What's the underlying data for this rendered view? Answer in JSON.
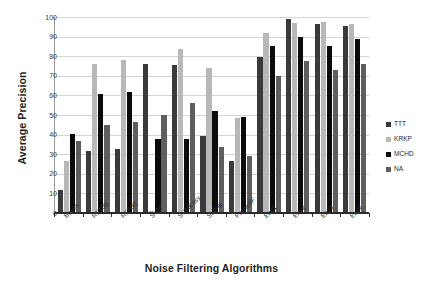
{
  "chart_data": {
    "type": "bar",
    "title": "",
    "xlabel": "Noise Filtering Algorithms",
    "ylabel": "Average Precision",
    "ylim": [
      0,
      100
    ],
    "yticks": [
      0,
      10,
      20,
      30,
      40,
      50,
      60,
      70,
      80,
      90,
      100
    ],
    "grid": true,
    "legend_position": "right",
    "categories": [
      "Bayes",
      "RF100",
      "RF500",
      "SVM",
      "SVMEasy",
      "SatFilt",
      "PruneSF",
      "Ens1",
      "Ens2",
      "Ens3",
      "Ens4"
    ],
    "series": [
      {
        "name": "TTT",
        "color": "#3a3a3a",
        "values": [
          11,
          31,
          32,
          75.3,
          75.1,
          39,
          25.8,
          79,
          98.5,
          96,
          95
        ]
      },
      {
        "name": "KRKP",
        "color": "#b8b8b8",
        "values": [
          26,
          75.7,
          77.6,
          0.6,
          83,
          73.5,
          48.2,
          91.3,
          96.5,
          97,
          96.1
        ]
      },
      {
        "name": "MCHD",
        "color": "#0b0b0b",
        "values": [
          40,
          60,
          61,
          37,
          37.5,
          51.6,
          48.5,
          84.6,
          89.5,
          84.7,
          88.3
        ]
      },
      {
        "name": "NA",
        "color": "#5e5e5e",
        "values": [
          36.2,
          44.6,
          46.1,
          49.6,
          55.8,
          33,
          28.8,
          69.4,
          76.8,
          72.6,
          75.5
        ]
      }
    ]
  }
}
